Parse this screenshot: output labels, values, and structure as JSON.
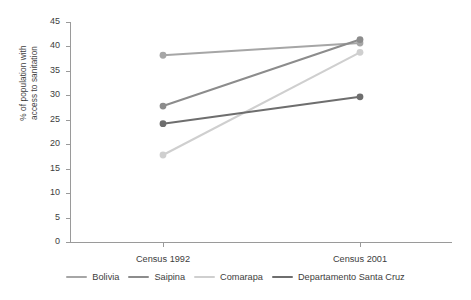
{
  "chart_data": {
    "type": "line",
    "title": "",
    "xlabel": "",
    "ylabel": "% of population with access to sanitation",
    "ylabel_line1": "% of population with",
    "ylabel_line2": "access to sanitation",
    "categories": [
      "Census 1992",
      "Census 2001"
    ],
    "ylim": [
      0,
      45
    ],
    "ytick_step": 5,
    "yticks": [
      45,
      40,
      35,
      30,
      25,
      20,
      15,
      10,
      5,
      0
    ],
    "grid": false,
    "legend_position": "bottom",
    "markers": "filled-circle",
    "series": [
      {
        "name": "Bolivia",
        "values": [
          38.2,
          40.7
        ],
        "color": "#a6a6a6"
      },
      {
        "name": "Saipina",
        "values": [
          27.8,
          41.4
        ],
        "color": "#8c8c8c"
      },
      {
        "name": "Comarapa",
        "values": [
          17.8,
          38.8
        ],
        "color": "#cfcfcf"
      },
      {
        "name": "Departamento Santa Cruz",
        "values": [
          24.2,
          29.7
        ],
        "color": "#6e6e6e"
      }
    ]
  },
  "axis": {
    "y_title_line1": "% of population with",
    "y_title_line2": "access to sanitation",
    "ticks_y": [
      "45",
      "40",
      "35",
      "30",
      "25",
      "20",
      "15",
      "10",
      "5",
      "0"
    ],
    "ticks_x": [
      "Census 1992",
      "Census 2001"
    ]
  },
  "legend": {
    "items": [
      {
        "label": "Bolivia",
        "color": "#a6a6a6"
      },
      {
        "label": "Saipina",
        "color": "#8c8c8c"
      },
      {
        "label": "Comarapa",
        "color": "#cfcfcf"
      },
      {
        "label": "Departamento Santa Cruz",
        "color": "#6e6e6e"
      }
    ]
  }
}
